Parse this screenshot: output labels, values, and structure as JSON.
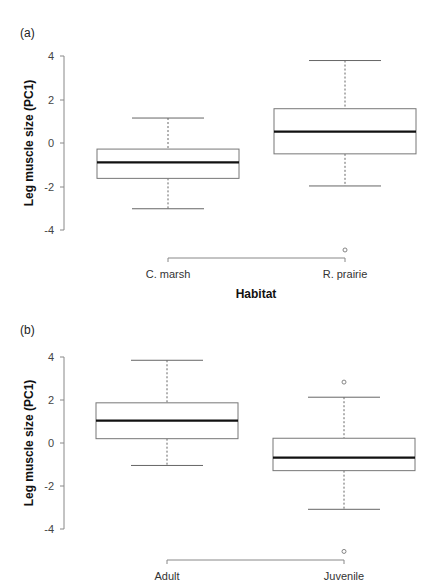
{
  "chart_data": [
    {
      "type": "box",
      "panel_label": "(a)",
      "title": "",
      "xlabel": "Habitat",
      "ylabel": "Leg muscle size (PC1)",
      "ylim": [
        -4,
        4
      ],
      "yticks": [
        4,
        2,
        0,
        -2,
        -4
      ],
      "grid": false,
      "categories": [
        "C. marsh",
        "R. prairie"
      ],
      "series": [
        {
          "name": "C. marsh",
          "whisker_high": 1.15,
          "q3": -0.28,
          "median": -0.89,
          "q1": -1.63,
          "whisker_low": -3.03,
          "outliers": []
        },
        {
          "name": "R. prairie",
          "whisker_high": 3.8,
          "q3": 1.58,
          "median": 0.52,
          "q1": -0.5,
          "whisker_low": -1.98,
          "outliers": [
            -4.93
          ]
        }
      ]
    },
    {
      "type": "box",
      "panel_label": "(b)",
      "title": "",
      "xlabel": "",
      "ylabel": "Leg muscle size (PC1)",
      "ylim": [
        -4,
        4
      ],
      "yticks": [
        4,
        2,
        0,
        -2,
        -4
      ],
      "grid": false,
      "categories": [
        "Adult",
        "Juvenile"
      ],
      "series": [
        {
          "name": "Adult",
          "whisker_high": 3.83,
          "q3": 1.86,
          "median": 1.04,
          "q1": 0.2,
          "whisker_low": -1.04,
          "outliers": []
        },
        {
          "name": "Juvenile",
          "whisker_high": 2.12,
          "q3": 0.22,
          "median": -0.68,
          "q1": -1.28,
          "whisker_low": -3.07,
          "outliers": [
            2.82,
            -5.02
          ]
        }
      ]
    }
  ],
  "panels": [
    {
      "label": "(a)",
      "ylabel": "Leg muscle size (PC1)",
      "xlabel": "Habitat",
      "ticks": [
        "4",
        "2",
        "0",
        "-2",
        "-4"
      ],
      "categories": [
        "C. marsh",
        "R. prairie"
      ]
    },
    {
      "label": "(b)",
      "ylabel": "Leg muscle size (PC1)",
      "xlabel": "",
      "ticks": [
        "4",
        "2",
        "0",
        "-2",
        "-4"
      ],
      "categories": [
        "Adult",
        "Juvenile"
      ]
    }
  ],
  "colors": {
    "axis": "#888888",
    "box": "#777777",
    "median": "#111111",
    "whisker": "#666666"
  }
}
